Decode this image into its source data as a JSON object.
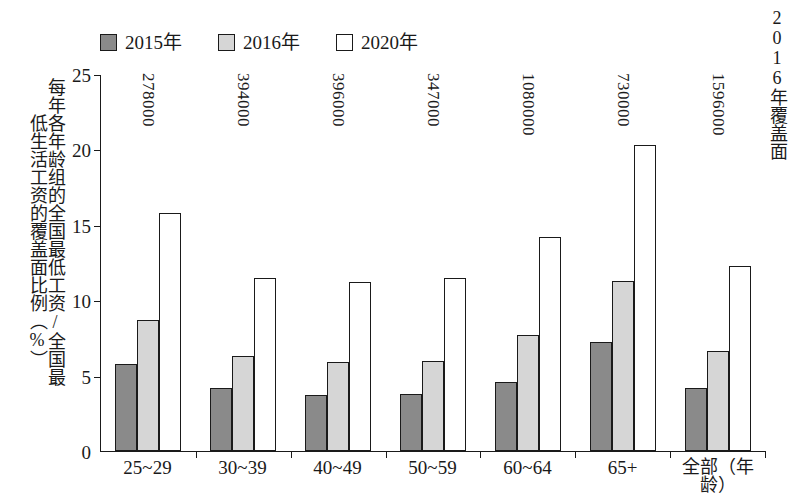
{
  "chart_data": {
    "type": "bar",
    "title": "",
    "xlabel": "年龄",
    "ylabel": "每年各年龄组的全国最低工资/全国最低生活工资的覆盖面比例（%）",
    "ylim": [
      0,
      25
    ],
    "yticks": [
      0,
      5,
      10,
      15,
      20,
      25
    ],
    "grid": false,
    "legend_position": "top-left",
    "categories": [
      "25~29",
      "30~39",
      "40~49",
      "50~59",
      "60~64",
      "65+",
      "全部（年龄）"
    ],
    "series": [
      {
        "name": "2015年",
        "color": "#8a8a8a",
        "values": [
          5.8,
          4.2,
          3.7,
          3.8,
          4.6,
          7.2,
          4.2
        ]
      },
      {
        "name": "2016年",
        "color": "#d6d6d6",
        "values": [
          8.7,
          6.3,
          5.9,
          6.0,
          7.7,
          11.3,
          6.6
        ]
      },
      {
        "name": "2020年",
        "color": "#ffffff",
        "values": [
          15.8,
          11.5,
          11.2,
          11.5,
          14.2,
          20.3,
          12.3
        ]
      }
    ],
    "group_annotations": [
      "278000",
      "394000",
      "396000",
      "347000",
      "1080000",
      "730000",
      "1596000"
    ],
    "annotation_note": "2016年覆盖面"
  },
  "legend": {
    "items": [
      {
        "label": "2015年",
        "swatch": "dark-gray-square"
      },
      {
        "label": "2016年",
        "swatch": "light-gray-square"
      },
      {
        "label": "2020年",
        "swatch": "white-square"
      }
    ]
  },
  "axes": {
    "y_title_col_right": "每年各年龄组的全国最低工资/全国最",
    "y_title_col_left": "低生活工资的覆盖面比例（%）",
    "y_tick_labels": [
      "25",
      "20",
      "15",
      "10",
      "5",
      "0"
    ],
    "x_tick_labels": [
      "25~29",
      "30~39",
      "40~49",
      "50~59",
      "60~64",
      "65+",
      "全部（年龄）"
    ]
  },
  "annotations": {
    "top_right_note": "2016年覆盖面"
  }
}
